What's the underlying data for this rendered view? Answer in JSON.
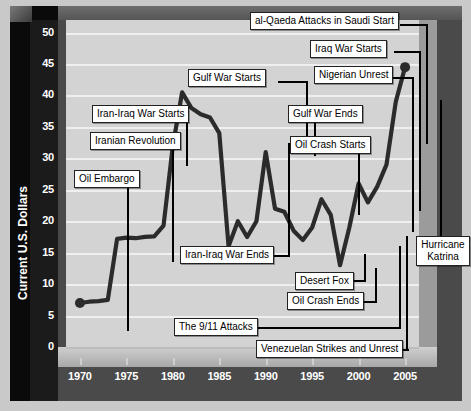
{
  "chart_data": {
    "type": "line",
    "title": "",
    "xlabel": "",
    "ylabel": "Current U.S. Dollars",
    "xlim": [
      1968.5,
      2006.5
    ],
    "ylim": [
      0,
      52
    ],
    "grid": true,
    "legend": "none",
    "y_ticks": [
      "0",
      "5",
      "10",
      "15",
      "20",
      "25",
      "30",
      "35",
      "40",
      "45",
      "50"
    ],
    "x_ticks": [
      "1970",
      "1975",
      "1980",
      "1985",
      "1990",
      "1995",
      "2000",
      "2005"
    ],
    "marker_points": [
      {
        "x": 1970,
        "y": 7.0
      },
      {
        "x": 2005,
        "y": 44.5
      }
    ],
    "x": [
      1970,
      1971,
      1972,
      1973,
      1974,
      1975,
      1976,
      1977,
      1978,
      1979,
      1980,
      1981,
      1982,
      1983,
      1984,
      1985,
      1986,
      1987,
      1988,
      1989,
      1990,
      1991,
      1992,
      1993,
      1994,
      1995,
      1996,
      1997,
      1998,
      1999,
      2000,
      2001,
      2002,
      2003,
      2004,
      2005
    ],
    "values": [
      7.0,
      7.2,
      7.3,
      7.5,
      17.2,
      17.4,
      17.3,
      17.5,
      17.6,
      19.3,
      32.0,
      40.5,
      38.0,
      37.0,
      36.5,
      34.0,
      16.0,
      20.0,
      17.5,
      20.0,
      31.0,
      22.0,
      21.5,
      18.5,
      17.0,
      19.0,
      23.5,
      21.0,
      13.0,
      19.0,
      26.0,
      23.0,
      25.5,
      29.0,
      39.0,
      44.5
    ],
    "annotations": [
      {
        "label": "Oil Embargo",
        "x": 1973.5,
        "y": 7.4
      },
      {
        "label": "Iranian Revolution",
        "x": 1979.0,
        "y": 19.3
      },
      {
        "label": "Iran-Iraq War Starts",
        "x": 1980.5,
        "y": 34.0
      },
      {
        "label": "Gulf War Starts",
        "x": 1990.3,
        "y": 31.0
      },
      {
        "label": "Iran-Iraq War Ends",
        "x": 1988.2,
        "y": 17.5
      },
      {
        "label": "Gulf War Ends",
        "x": 1991.2,
        "y": 22.0
      },
      {
        "label": "Oil Crash Starts",
        "x": 1996.6,
        "y": 23.5
      },
      {
        "label": "Nigerian Unrest",
        "x": 2002.6,
        "y": 25.5
      },
      {
        "label": "Iraq War Starts",
        "x": 2003.2,
        "y": 29.0
      },
      {
        "label": "al-Qaeda Attacks in Saudi Start",
        "x": 2003.9,
        "y": 39.0
      },
      {
        "label": "Desert Fox",
        "x": 1998.4,
        "y": 13.0
      },
      {
        "label": "Oil Crash Ends",
        "x": 1998.9,
        "y": 13.0
      },
      {
        "label": "The 9/11 Attacks",
        "x": 2001.3,
        "y": 23.0
      },
      {
        "label": "Venezuelan Strikes and Unrest",
        "x": 2002.2,
        "y": 25.5
      },
      {
        "label": "Hurricane Katrina",
        "x": 2005.0,
        "y": 44.5
      }
    ]
  },
  "axis": {
    "y_label": "Current U.S. Dollars",
    "y_ticks": [
      "50",
      "45",
      "40",
      "35",
      "30",
      "25",
      "20",
      "15",
      "10",
      "5",
      "0"
    ],
    "x_ticks": [
      "1970",
      "1975",
      "1980",
      "1985",
      "1990",
      "1995",
      "2000",
      "2005"
    ]
  },
  "callouts": {
    "oil_embargo": "Oil Embargo",
    "iranian_revolution": "Iranian Revolution",
    "iran_iraq_war_starts": "Iran-Iraq War Starts",
    "iran_iraq_war_ends": "Iran-Iraq War Ends",
    "gulf_war_starts": "Gulf War Starts",
    "gulf_war_ends": "Gulf War Ends",
    "oil_crash_starts": "Oil Crash Starts",
    "oil_crash_ends": "Oil Crash Ends",
    "desert_fox": "Desert Fox",
    "the_911_attacks": "The 9/11 Attacks",
    "venezuelan_strikes": "Venezuelan Strikes and Unrest",
    "nigerian_unrest": "Nigerian Unrest",
    "iraq_war_starts": "Iraq War Starts",
    "alqaeda_saudi": "al-Qaeda Attacks in Saudi Start",
    "hurricane_katrina_l1": "Hurricane",
    "hurricane_katrina_l2": "Katrina"
  },
  "colors": {
    "background": "#c9c9c9",
    "chart_frame": "#4a4a4a",
    "wall": "#1b1b1b",
    "plot_area": "#d3d3d3",
    "gridline": "#efefef",
    "data_line": "#2b2b2b",
    "callout_bg": "#ffffff",
    "callout_border": "#222222",
    "tick_text": "#ffffff"
  }
}
